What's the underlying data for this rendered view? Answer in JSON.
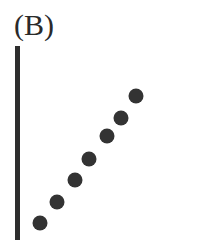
{
  "panel": {
    "label": "(B)"
  },
  "chart_data": {
    "type": "scatter",
    "title": "(B)",
    "xlabel": "",
    "ylabel": "",
    "x": [
      1,
      2,
      3,
      4,
      5,
      6,
      7
    ],
    "series": [
      {
        "name": "points",
        "values": [
          1,
          2,
          3,
          4,
          5,
          6,
          7
        ]
      }
    ],
    "pixel_points": [
      [
        40,
        223
      ],
      [
        57,
        202
      ],
      [
        75,
        180
      ],
      [
        89,
        159
      ],
      [
        107,
        136
      ],
      [
        121,
        118
      ],
      [
        136,
        96
      ]
    ],
    "axes": {
      "y_axis_visible": true,
      "x_axis_visible": false,
      "ticks": false
    },
    "grid": false,
    "legend": null,
    "colors": {
      "axis": "#2e2e2e",
      "point": "#333333"
    }
  }
}
